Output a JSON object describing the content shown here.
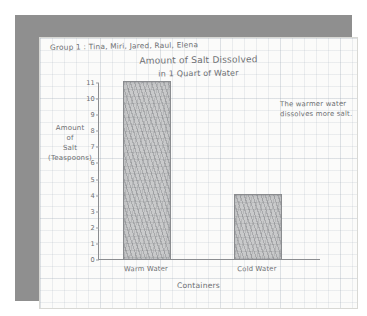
{
  "poster": {
    "header": "Group 1 : Tina, Miri, Jared, Raul, Elena",
    "annotation": "The warmer water dissolves more salt.",
    "frame_color": "#8f8f8f",
    "paper_color": "#fbfbfa",
    "pencil_color": "#6d6f72"
  },
  "chart_data": {
    "type": "bar",
    "title": "Amount of Salt Dissolved",
    "subtitle": "in 1 Quart of Water",
    "categories": [
      "Warm Water",
      "Cold Water"
    ],
    "values": [
      11,
      4
    ],
    "xlabel": "Containers",
    "ylabel": "Amount of Salt (Teaspoons)",
    "ylabel_lines": [
      "Amount",
      "of",
      "Salt",
      "(Teaspoons)"
    ],
    "ylim": [
      0,
      11
    ],
    "yticks": [
      11,
      10,
      9,
      8,
      7,
      6,
      5,
      4,
      3,
      2,
      1,
      0
    ],
    "grid": true,
    "legend": null
  }
}
